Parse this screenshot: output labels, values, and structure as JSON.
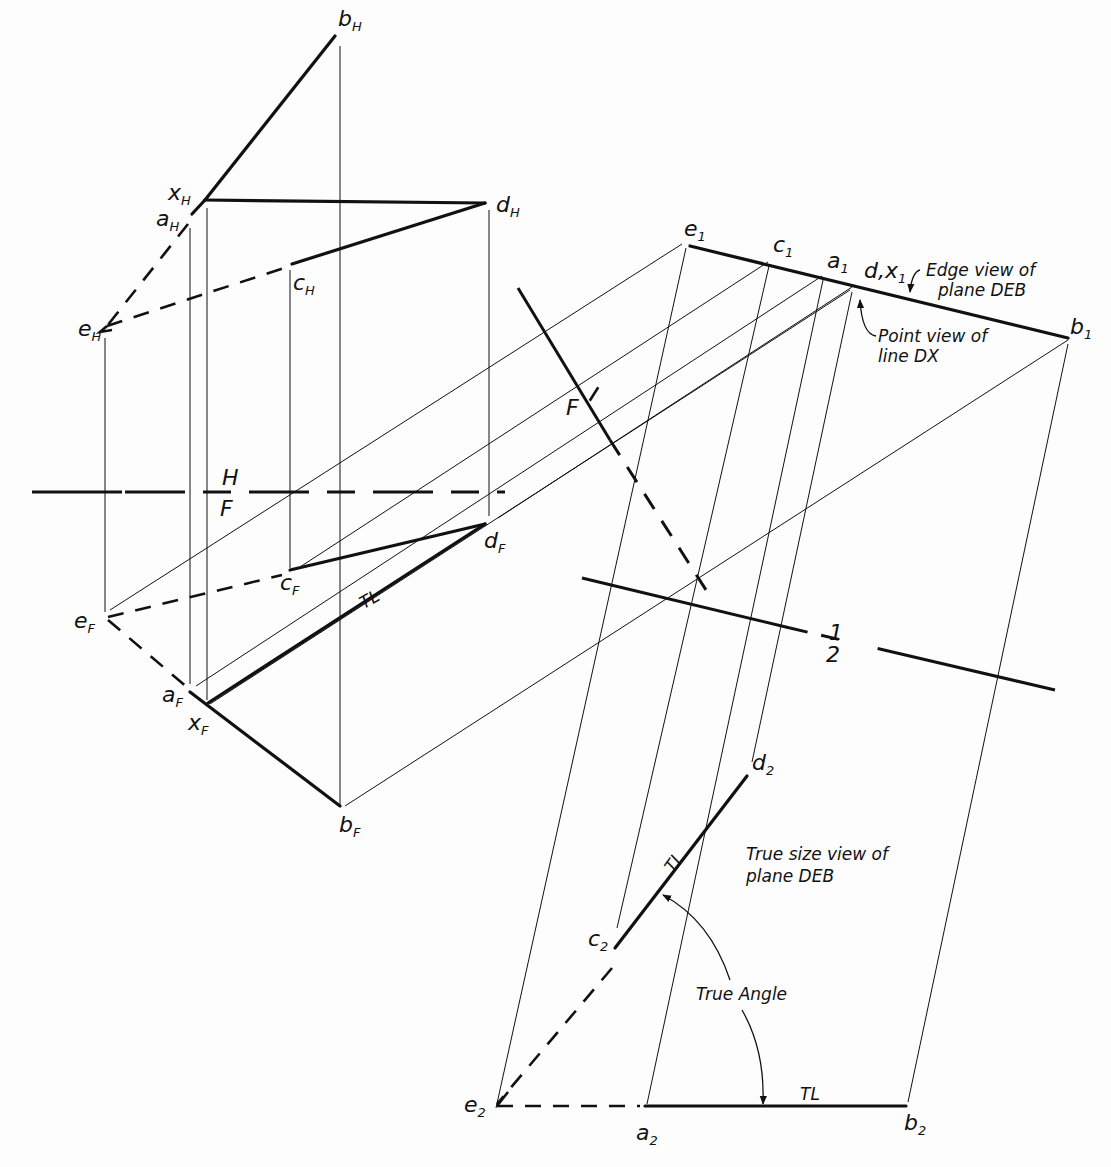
{
  "colors": {
    "ink": "#111111",
    "paper": "#fdfdfd"
  },
  "labels": {
    "points": [
      {
        "id": "bH",
        "base": "b",
        "sub": "H",
        "x": 338,
        "y": 26
      },
      {
        "id": "xH",
        "base": "x",
        "sub": "H",
        "x": 168,
        "y": 200
      },
      {
        "id": "aH",
        "base": "a",
        "sub": "H",
        "x": 160,
        "y": 226
      },
      {
        "id": "dH",
        "base": "d",
        "sub": "H",
        "x": 496,
        "y": 212
      },
      {
        "id": "cH",
        "base": "c",
        "sub": "H",
        "x": 293,
        "y": 290
      },
      {
        "id": "eH",
        "base": "e",
        "sub": "H",
        "x": 80,
        "y": 336
      },
      {
        "id": "dF",
        "base": "d",
        "sub": "F",
        "x": 484,
        "y": 548
      },
      {
        "id": "cF",
        "base": "c",
        "sub": "F",
        "x": 280,
        "y": 590
      },
      {
        "id": "eF",
        "base": "e",
        "sub": "F",
        "x": 74,
        "y": 628
      },
      {
        "id": "aF",
        "base": "a",
        "sub": "F",
        "x": 162,
        "y": 702
      },
      {
        "id": "xF",
        "base": "x",
        "sub": "F",
        "x": 190,
        "y": 730
      },
      {
        "id": "bF",
        "base": "b",
        "sub": "F",
        "x": 339,
        "y": 832
      },
      {
        "id": "e1",
        "base": "e",
        "sub": "1",
        "x": 686,
        "y": 234
      },
      {
        "id": "c1",
        "base": "c",
        "sub": "1",
        "x": 775,
        "y": 250
      },
      {
        "id": "a1",
        "base": "a",
        "sub": "1",
        "x": 829,
        "y": 266
      },
      {
        "id": "d1x1",
        "base": "d,x",
        "sub": "1",
        "x": 865,
        "y": 276
      },
      {
        "id": "b1",
        "base": "b",
        "sub": "1",
        "x": 1070,
        "y": 334
      },
      {
        "id": "d2",
        "base": "d",
        "sub": "2",
        "x": 752,
        "y": 770
      },
      {
        "id": "c2",
        "base": "c",
        "sub": "2",
        "x": 590,
        "y": 948
      },
      {
        "id": "e2",
        "base": "e",
        "sub": "2",
        "x": 466,
        "y": 1112
      },
      {
        "id": "a2",
        "base": "a",
        "sub": "2",
        "x": 636,
        "y": 1140
      },
      {
        "id": "b2",
        "base": "b",
        "sub": "2",
        "x": 904,
        "y": 1130
      }
    ],
    "fold_HF_top": "H",
    "fold_HF_bottom": "F",
    "fold_F1_top": "1",
    "fold_F1_bottom": "F",
    "fold_12_top": "1",
    "fold_12_bottom": "2",
    "tl_front": "TL",
    "tl_view2_cd": "TL",
    "tl_view2_ab": "TL",
    "edge_view_line1": "Edge view of",
    "edge_view_line2": "plane DEB",
    "point_view_line1": "Point view of",
    "point_view_line2": "line DX",
    "true_size_line1": "True size view of",
    "true_size_line2": "plane DEB",
    "true_angle": "True Angle"
  }
}
